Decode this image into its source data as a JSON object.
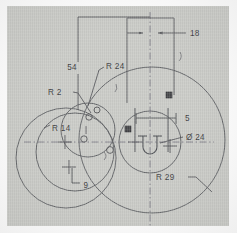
{
  "drawing": {
    "title": "Mechanical part technical drawing",
    "sheet_color": "#c9cac6",
    "line_color": "#55565a",
    "text_color": "#3b3b3e",
    "centerline_color": "#6d6b74",
    "annotations": {
      "dim_18": "18",
      "dim_54": "54",
      "radius_24": "R 24",
      "radius_2": "R 2",
      "radius_14": "R 14",
      "radius_29": "R 29",
      "dim_9": "9",
      "dim_5": "5",
      "diameter_24": "Ø 24"
    },
    "geometry": {
      "big_circle": {
        "cx": 152,
        "cy": 140,
        "r": 73,
        "label": "R 29"
      },
      "hub_circle": {
        "cx": 150,
        "cy": 142,
        "r": 31,
        "label": "Ø 24"
      },
      "left_outer_circle": {
        "cx": 66,
        "cy": 158,
        "r": 50
      },
      "left_inner_circle": {
        "cx": 75,
        "cy": 152,
        "r": 39
      },
      "mid_circle": {
        "cx": 88,
        "cy": 130,
        "r": 27,
        "label": "R 24"
      },
      "small_hole_upper": {
        "cx": 89,
        "cy": 117,
        "r": 3.2
      },
      "small_hole_lower": {
        "cx": 84,
        "cy": 139,
        "r": 3.2
      },
      "small_hole_right": {
        "cx": 110,
        "cy": 150,
        "r": 3.4
      },
      "small_hole_top": {
        "cx": 97,
        "cy": 110,
        "r": 3.0
      }
    }
  }
}
